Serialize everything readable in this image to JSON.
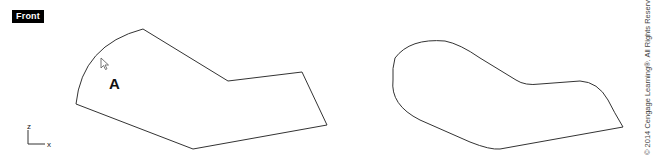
{
  "viewport": {
    "label": "Front"
  },
  "annotation": {
    "point_label": "A",
    "cursor_icon": "arrow-pointer-icon"
  },
  "axes": {
    "z_label": "z",
    "x_label": "x"
  },
  "shapes": {
    "left": {
      "description": "Polyline with sharp corners and one arc edge (before fillet)",
      "stroke": "#333333"
    },
    "right": {
      "description": "Same outline with filleted (rounded) corners",
      "stroke": "#333333"
    }
  },
  "footer": {
    "copyright": "© 2014 Cengage Learning®. All Rights Reserved."
  }
}
